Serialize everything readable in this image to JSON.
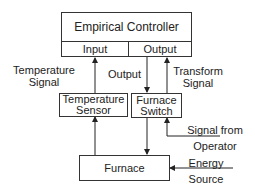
{
  "controller": {
    "title": "Empirical Controller",
    "input": "Input",
    "output": "Output"
  },
  "sensor": {
    "line1": "Temperature",
    "line2": "Sensor"
  },
  "switch": {
    "line1": "Furnace",
    "line2": "Switch"
  },
  "furnace": {
    "label": "Furnace"
  },
  "labels": {
    "temp_signal_1": "Temperature",
    "temp_signal_2": "Signal",
    "output": "Output",
    "transform_1": "Transform",
    "transform_2": "Signal",
    "operator_1": "Signal from",
    "operator_2": "Operator",
    "energy_1": "Energy",
    "energy_2": "Source"
  }
}
